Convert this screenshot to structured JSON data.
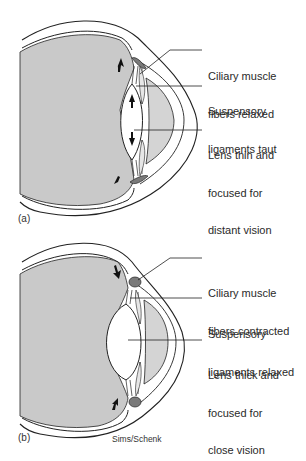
{
  "figure": {
    "credit": "Sims/Schenk",
    "colors": {
      "vitreous_gray": "#c9c9c9",
      "aqueous_gray": "#d4d4d4",
      "ciliary_muscle": "#7a7a7a",
      "outline": "#222222",
      "lens": "#ffffff"
    }
  },
  "panels": [
    {
      "tag": "(a)",
      "state": "distant vision",
      "labels": [
        {
          "id": "ciliary",
          "line1": "Ciliary muscle",
          "line2": "fibers relaxed"
        },
        {
          "id": "ligaments",
          "line1": "Suspensory",
          "line2": "ligaments taut"
        },
        {
          "id": "lens",
          "line1": "Lens thin and",
          "line2": "focused for",
          "line3": "distant vision"
        }
      ]
    },
    {
      "tag": "(b)",
      "state": "close vision",
      "labels": [
        {
          "id": "ciliary",
          "line1": "Ciliary muscle",
          "line2": "fibers contracted"
        },
        {
          "id": "ligaments",
          "line1": "Suspensory",
          "line2": "ligaments relaxed"
        },
        {
          "id": "lens",
          "line1": "Lens thick and",
          "line2": "focused for",
          "line3": "close vision"
        }
      ]
    }
  ]
}
